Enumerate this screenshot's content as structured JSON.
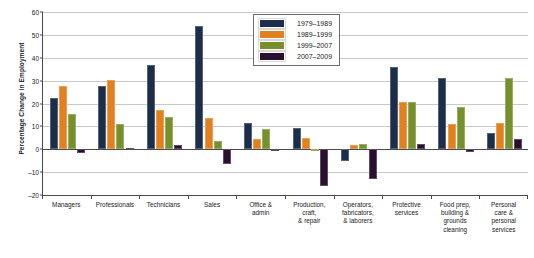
{
  "chart_data": {
    "type": "bar",
    "title": "",
    "xlabel": "",
    "ylabel": "Percentage Change in Employment",
    "ylim": [
      -20,
      60
    ],
    "yticks": [
      60,
      50,
      40,
      30,
      20,
      10,
      0,
      -10,
      -20
    ],
    "grid": true,
    "legend_position": "top-center-right",
    "categories": [
      "Managers",
      "Professionals",
      "Technicians",
      "Sales",
      "Office &\nadmin",
      "Production,\ncraft,\n& repair",
      "Operators,\nfabricators,\n& laborers",
      "Protective\nservices",
      "Food prep,\nbuilding &\ngrounds\ncleaning",
      "Personal\ncare &\npersonal\nservices"
    ],
    "series": [
      {
        "name": "1979–1989",
        "color": "#1c2e4a",
        "values": [
          22.5,
          27.8,
          37.0,
          54.0,
          11.5,
          9.5,
          -5.0,
          36.0,
          31.0,
          7.0
        ]
      },
      {
        "name": "1989–1999",
        "color": "#e2801e",
        "values": [
          27.5,
          30.3,
          17.0,
          13.5,
          4.5,
          5.0,
          2.0,
          20.5,
          11.0,
          11.5
        ]
      },
      {
        "name": "1999–2007",
        "color": "#76902e",
        "values": [
          15.5,
          11.2,
          14.0,
          3.5,
          9.0,
          0.0,
          2.5,
          20.5,
          18.5,
          31.0
        ]
      },
      {
        "name": "2007–2009",
        "color": "#2b0f2e",
        "values": [
          -1.5,
          0.5,
          2.0,
          -6.5,
          -0.5,
          -16.0,
          -13.0,
          2.5,
          -1.0,
          4.5
        ]
      }
    ]
  }
}
